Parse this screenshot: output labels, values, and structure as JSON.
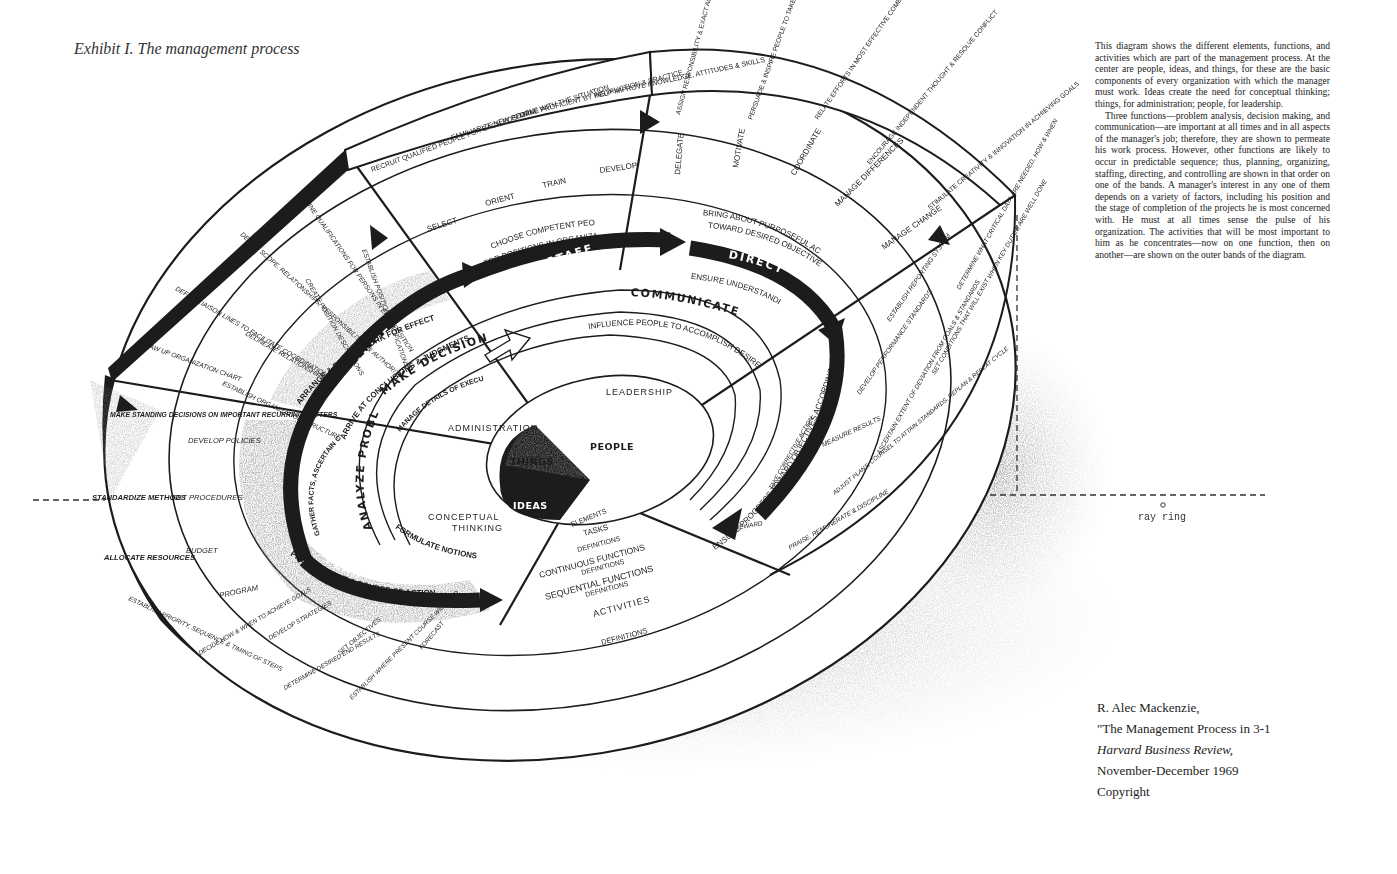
{
  "title": "Exhibit I. The management process",
  "description": [
    "This diagram shows the different elements, functions, and activities which are part of the management process. At the center are people, ideas, and things, for these are the basic components of every organization with which the manager must work. Ideas create the need for conceptual thinking; things, for administration; people, for leadership.",
    "Three functions—problem analysis, decision making, and communication—are important at all times and in all aspects of the manager's job; therefore, they are shown to permeate his work process. However, other functions are likely to occur in predictable sequence; thus, planning, organizing, staffing, directing, and controlling are shown in that order on one of the bands. A manager's interest in any one of them depends on a variety of factors, including his position and the stage of completion of the projects he is most concerned with. He must at all times sense the pulse of his organization. The activities that will be most important to him as he concentrates—now on one function, then on another—are shown on the outer bands of the diagram."
  ],
  "citation": {
    "author": "R. Alec Mackenzie,",
    "article": "\"The Management Process in 3-1",
    "journal": "Harvard Business Review,",
    "date": "November-December 1969",
    "rights": "Copyright"
  },
  "signature": "ray ring",
  "colors": {
    "ink": "#1c1c1c",
    "paper": "#ffffff",
    "shade": "#8a8a8a"
  },
  "diagram": {
    "elements": {
      "people": "PEOPLE",
      "ideas": "IDEAS",
      "things": "THINGS"
    },
    "tasks": {
      "leadership": "LEADERSHIP",
      "administration": "ADMINISTRATION",
      "conceptual": [
        "CONCEPTUAL",
        "THINKING"
      ]
    },
    "legend": [
      "ELEMENTS",
      "TASKS",
      "DEFINITIONS",
      "CONTINUOUS FUNCTIONS",
      "DEFINITIONS",
      "SEQUENTIAL FUNCTIONS",
      "DEFINITIONS",
      "ACTIVITIES",
      "DEFINITIONS"
    ],
    "continuous_functions": {
      "analyze": {
        "label": "ANALYZE PROBLEMS",
        "definition": "FORMULATE NOTIONS"
      },
      "decide": {
        "label": "MAKE DECISIONS",
        "definition": "MANAGE DETAILS OF EXECUTIVE AFFAIRS"
      },
      "communicate": {
        "label": "COMMUNICATE",
        "definition": "INFLUENCE PEOPLE TO ACCOMPLISH DESIRED GOALS"
      }
    },
    "sequential_functions": {
      "plan": {
        "label": "PLAN",
        "definition": "PREDETERMINE A COURSE OF ACTION",
        "inner": [
          "GATHER FACTS, ASCERTAIN CAUSES,",
          "DEVELOP ALTERNATE SOLUTIONS"
        ]
      },
      "organize": {
        "label": "ORGANIZE",
        "definition": "ARRANGE & RELATE WORK FOR EFFECTIVE ACCOMPLISHMENT OF OBJECTIVES",
        "inner": "ARRIVE AT CONCLUSIONS & JUDGMENTS"
      },
      "staff": {
        "label": "STAFF",
        "definition": [
          "CHOOSE COMPETENT PEOPLE",
          "FOR POSITIONS IN ORGANIZATION"
        ]
      },
      "direct": {
        "label": "DIRECT",
        "definition": [
          "BRING ABOUT PURPOSEFUL ACTION",
          "TOWARD DESIRED OBJECTIVES"
        ],
        "inner": "ENSURE UNDERSTANDING"
      },
      "control": {
        "label": "CONTROL",
        "definition": "ENSURE PROGRESS TOWARD OBJECTIVES ACCORDING TO PLAN"
      }
    },
    "activities": {
      "plan": [
        {
          "activity": "FORECAST",
          "definition": "ESTABLISH WHERE PRESENT COURSE WILL LEAD"
        },
        {
          "activity": "SET OBJECTIVES",
          "definition": "DETERMINE DESIRED END RESULTS"
        },
        {
          "activity": "DEVELOP STRATEGIES",
          "definition": "DECIDE HOW & WHEN TO ACHIEVE GOALS"
        },
        {
          "activity": "PROGRAM",
          "definition": "ESTABLISH PRIORITY, SEQUENCE & TIMING OF STEPS"
        },
        {
          "activity": "BUDGET",
          "definition": "ALLOCATE RESOURCES"
        },
        {
          "activity": "SET PROCEDURES",
          "definition": "STANDARDIZE METHODS"
        },
        {
          "activity": "DEVELOP POLICIES",
          "definition": "MAKE STANDING DECISIONS ON IMPORTANT RECURRING MATTERS"
        }
      ],
      "organize": [
        {
          "activity": "ESTABLISH ORGANIZATION STRUCTURE",
          "definition": "DRAW UP ORGANIZATION CHART"
        },
        {
          "activity": "DELINEATE RELATIONSHIPS",
          "definition": "DEFINE LIAISON LINES TO FACILITATE COORDINATION"
        },
        {
          "activity": "CREATE POSITION DESCRIPTIONS",
          "definition": "DEFINE SCOPE, RELATIONSHIPS, RESPONSIBILITIES & AUTHORITY"
        },
        {
          "activity": "ESTABLISH POSITION QUALIFICATIONS",
          "definition": "DEFINE QUALIFICATIONS FOR PERSONS IN EACH POSITION"
        }
      ],
      "staff": [
        {
          "activity": "SELECT",
          "definition": "RECRUIT QUALIFIED PEOPLE FOR EACH POSITION"
        },
        {
          "activity": "ORIENT",
          "definition": "FAMILIARIZE NEW PEOPLE WITH THE SITUATION"
        },
        {
          "activity": "TRAIN",
          "definition": "MAKE PROFICIENT BY INSTRUCTION & PRACTICE"
        },
        {
          "activity": "DEVELOP",
          "definition": "HELP IMPROVE KNOWLEDGE, ATTITUDES & SKILLS"
        }
      ],
      "direct": [
        {
          "activity": "DELEGATE",
          "definition": "ASSIGN RESPONSIBILITY & EXACT ACCOUNTABILITY FOR RESULTS"
        },
        {
          "activity": "MOTIVATE",
          "definition": "PERSUADE & INSPIRE PEOPLE TO TAKE DESIRED ACTION"
        },
        {
          "activity": "COORDINATE",
          "definition": "RELATE EFFORTS IN MOST EFFECTIVE COMBINATION"
        },
        {
          "activity": "MANAGE DIFFERENCES",
          "definition": "ENCOURAGE INDEPENDENT THOUGHT & RESOLVE CONFLICT"
        },
        {
          "activity": "MANAGE CHANGE",
          "definition": "STIMULATE CREATIVITY & INNOVATION IN ACHIEVING GOALS"
        }
      ],
      "control": [
        {
          "activity": "ESTABLISH REPORTING SYSTEM",
          "definition": "DETERMINE WHAT CRITICAL DATA ARE NEEDED, HOW & WHEN"
        },
        {
          "activity": "DEVELOP PERFORMANCE STANDARDS",
          "definition": "SET CONDITIONS THAT WILL EXIST WHEN KEY DUTIES ARE WELL DONE"
        },
        {
          "activity": "MEASURE RESULTS",
          "definition": "ASCERTAIN EXTENT OF DEVIATION FROM GOALS & STANDARDS"
        },
        {
          "activity": "TAKE CORRECTIVE ACTION",
          "definition": "ADJUST PLANS, COUNSEL TO ATTAIN STANDARDS, REPLAN & REPEAT CYCLE"
        },
        {
          "activity": "REWARD",
          "definition": "PRAISE, REMUNERATE & DISCIPLINE"
        }
      ]
    }
  }
}
